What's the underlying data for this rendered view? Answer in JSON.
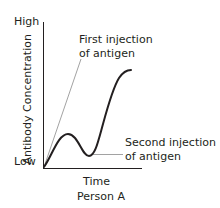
{
  "diagram": {
    "type": "antibody-response-curve",
    "y_axis": {
      "label": "Antibody Concentration",
      "high_label": "High",
      "low_label": "Low"
    },
    "x_axis": {
      "label": "Time"
    },
    "caption": "Person A",
    "annotations": {
      "first_injection": {
        "line1": "First injection",
        "line2": "of antigen"
      },
      "second_injection": {
        "line1": "Second injection",
        "line2": "of antigen"
      }
    },
    "colors": {
      "curve": "#231f20",
      "axes": "#231f20",
      "pointer": "#8a8a8a",
      "text": "#231f20"
    }
  }
}
